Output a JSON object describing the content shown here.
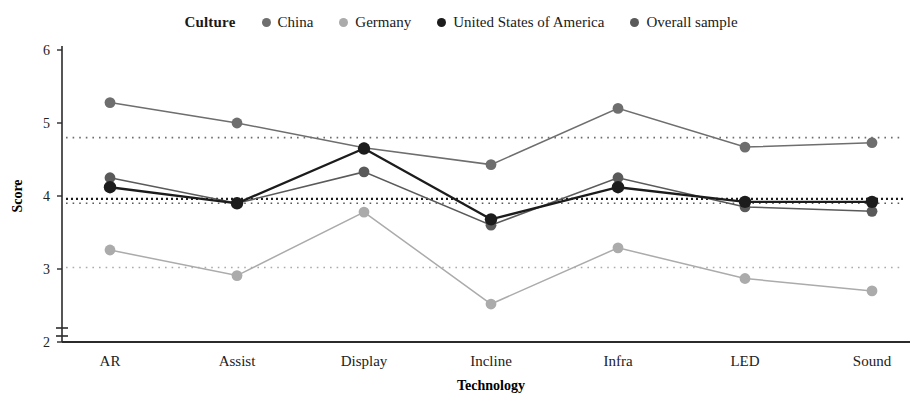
{
  "legend": {
    "title": "Culture",
    "items": [
      {
        "label": "China",
        "color": "#6e6e6e",
        "marker": "legend-dot-china"
      },
      {
        "label": "Germany",
        "color": "#ababab",
        "marker": "legend-dot-germany"
      },
      {
        "label": "United States of America",
        "color": "#1c1c1c",
        "marker": "legend-dot-usa"
      },
      {
        "label": "Overall sample",
        "color": "#5a5a5a",
        "marker": "legend-dot-overall"
      }
    ]
  },
  "axes": {
    "y_title": "Score",
    "x_title": "Technology",
    "y_ticks": [
      "6",
      "5",
      "4",
      "3",
      "2"
    ],
    "x_ticks": [
      "AR",
      "Assist",
      "Display",
      "Incline",
      "Infra",
      "LED",
      "Sound"
    ],
    "y_break": true
  },
  "chart_data": {
    "type": "line",
    "title": "",
    "xlabel": "Technology",
    "ylabel": "Score",
    "ylim": [
      2,
      6
    ],
    "grid": false,
    "legend_position": "top-center",
    "legend_title": "Culture",
    "categories": [
      "AR",
      "Assist",
      "Display",
      "Incline",
      "Infra",
      "LED",
      "Sound"
    ],
    "series": [
      {
        "name": "China",
        "color": "#6e6e6e",
        "values": [
          5.28,
          5.0,
          4.66,
          4.43,
          5.2,
          4.67,
          4.73
        ],
        "reference_line": 4.8
      },
      {
        "name": "Germany",
        "color": "#ababab",
        "values": [
          3.26,
          2.91,
          3.78,
          2.52,
          3.29,
          2.87,
          2.7
        ],
        "reference_line": 3.02
      },
      {
        "name": "United States of America",
        "color": "#1c1c1c",
        "values": [
          4.12,
          3.9,
          4.65,
          3.68,
          4.12,
          3.92,
          3.92
        ],
        "reference_line": 3.96
      },
      {
        "name": "Overall sample",
        "color": "#5a5a5a",
        "values": [
          4.25,
          3.9,
          4.33,
          3.6,
          4.25,
          3.85,
          3.79
        ],
        "reference_line": 3.9
      }
    ],
    "reference_lines": [
      {
        "name": "China mean",
        "value": 4.8,
        "color": "#6e6e6e",
        "style": "dotted"
      },
      {
        "name": "Overall sample mean",
        "value": 3.9,
        "color": "#5a5a5a",
        "style": "dotted"
      },
      {
        "name": "United States of America mean",
        "value": 3.96,
        "color": "#1c1c1c",
        "style": "dotted"
      },
      {
        "name": "Germany mean",
        "value": 3.02,
        "color": "#ababab",
        "style": "dotted"
      }
    ]
  }
}
